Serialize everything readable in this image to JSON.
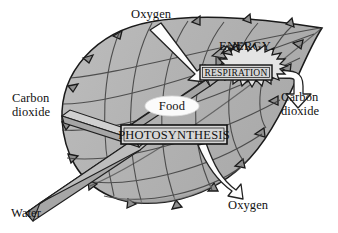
{
  "diagram": {
    "colors": {
      "leaf_fill": "#b4b4b4",
      "leaf_fill_light": "#c6c6c6",
      "leaf_outline": "#1a1a1a",
      "vein": "#3a3a3a",
      "arrow_white": "#fdfdfd",
      "arrow_outline": "#222222",
      "bar_face": "#a8a8a8",
      "bar_top": "#d2d2d2",
      "box_fill": "#d8d8d8",
      "text": "#111111",
      "page_background": "#ffffff"
    }
  },
  "processes": [
    {
      "id": "photosynthesis",
      "label": "PHOTOSYNTHESIS",
      "shape": "rectangle"
    },
    {
      "id": "respiration",
      "label": "RESPIRATION",
      "shape": "rectangle"
    },
    {
      "id": "energy",
      "label": "ENERGY",
      "shape": "starburst"
    },
    {
      "id": "food",
      "label": "Food",
      "shape": "ellipse"
    }
  ],
  "labels": {
    "oxygen_in": "Oxygen",
    "carbon_dioxide_in": "Carbon\ndioxide",
    "water_in": "Water",
    "carbon_dioxide_out": "Carbon\ndioxide",
    "oxygen_out": "Oxygen",
    "food": "Food"
  },
  "label_lines": {
    "carbon_dioxide_in_line1": "Carbon",
    "carbon_dioxide_in_line2": "dioxide",
    "carbon_dioxide_out_line1": "Carbon",
    "carbon_dioxide_out_line2": "dioxide"
  },
  "flows": [
    {
      "from": "Oxygen",
      "to": "RESPIRATION",
      "style": "white-arrow",
      "direction": "in"
    },
    {
      "from": "Carbon dioxide",
      "to": "PHOTOSYNTHESIS",
      "style": "bar-arrow",
      "direction": "in"
    },
    {
      "from": "Water",
      "to": "PHOTOSYNTHESIS",
      "style": "bar-arrow",
      "direction": "in"
    },
    {
      "from": "PHOTOSYNTHESIS",
      "to": "Food",
      "style": "bar-arrow",
      "direction": "out"
    },
    {
      "from": "Food",
      "to": "RESPIRATION",
      "style": "bar-arrow",
      "direction": "out"
    },
    {
      "from": "RESPIRATION",
      "to": "ENERGY",
      "style": "bar-arrow",
      "direction": "out"
    },
    {
      "from": "RESPIRATION",
      "to": "Carbon dioxide",
      "style": "white-arrow",
      "direction": "out"
    },
    {
      "from": "PHOTOSYNTHESIS",
      "to": "Oxygen",
      "style": "white-arrow",
      "direction": "out"
    }
  ]
}
